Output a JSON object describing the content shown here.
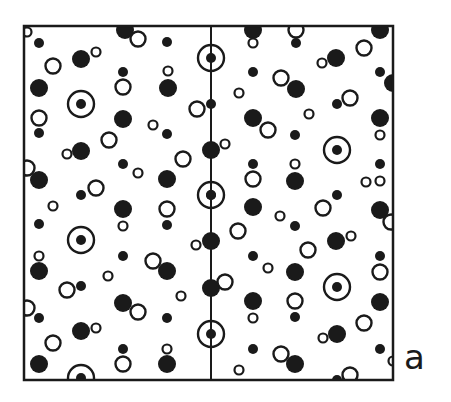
{
  "figure": {
    "panel_label": "a",
    "frame": {
      "x": 24,
      "y": 26,
      "width": 369,
      "height": 354
    },
    "mirror_line_x": 211,
    "colors": {
      "ink": "#1a1a1a",
      "background": "#ffffff"
    },
    "legend_note": "Symbols: filled large disc, filled small disc, open large ring, open small ring, target (ring with central dot)",
    "symbols": [
      {
        "t": "o",
        "x": 27,
        "y": 32
      },
      {
        "t": "f",
        "x": 39,
        "y": 43
      },
      {
        "t": "O",
        "x": 53,
        "y": 66
      },
      {
        "t": "F",
        "x": 81,
        "y": 59
      },
      {
        "t": "o",
        "x": 96,
        "y": 52
      },
      {
        "t": "F",
        "x": 125,
        "y": 30
      },
      {
        "t": "O",
        "x": 138,
        "y": 39
      },
      {
        "t": "f",
        "x": 167,
        "y": 42
      },
      {
        "t": "F",
        "x": 39,
        "y": 88
      },
      {
        "t": "f",
        "x": 123,
        "y": 72
      },
      {
        "t": "O",
        "x": 123,
        "y": 87
      },
      {
        "t": "o",
        "x": 168,
        "y": 71
      },
      {
        "t": "F",
        "x": 168,
        "y": 88
      },
      {
        "t": "T",
        "x": 81,
        "y": 104
      },
      {
        "t": "O",
        "x": 39,
        "y": 118
      },
      {
        "t": "f",
        "x": 39,
        "y": 133
      },
      {
        "t": "F",
        "x": 123,
        "y": 119
      },
      {
        "t": "o",
        "x": 153,
        "y": 125
      },
      {
        "t": "f",
        "x": 167,
        "y": 134
      },
      {
        "t": "T",
        "x": 211,
        "y": 58
      },
      {
        "t": "O",
        "x": 197,
        "y": 109
      },
      {
        "t": "f",
        "x": 211,
        "y": 104
      },
      {
        "t": "o",
        "x": 67,
        "y": 154
      },
      {
        "t": "F",
        "x": 81,
        "y": 151
      },
      {
        "t": "O",
        "x": 109,
        "y": 140
      },
      {
        "t": "f",
        "x": 123,
        "y": 164
      },
      {
        "t": "o",
        "x": 138,
        "y": 173
      },
      {
        "t": "F",
        "x": 167,
        "y": 179
      },
      {
        "t": "O",
        "x": 183,
        "y": 159
      },
      {
        "t": "F",
        "x": 211,
        "y": 150
      },
      {
        "t": "o",
        "x": 225,
        "y": 144
      },
      {
        "t": "O",
        "x": 27,
        "y": 168
      },
      {
        "t": "F",
        "x": 39,
        "y": 180
      },
      {
        "t": "f",
        "x": 81,
        "y": 195
      },
      {
        "t": "O",
        "x": 96,
        "y": 188
      },
      {
        "t": "T",
        "x": 211,
        "y": 195
      },
      {
        "t": "f",
        "x": 211,
        "y": 195
      },
      {
        "t": "o",
        "x": 53,
        "y": 206
      },
      {
        "t": "f",
        "x": 39,
        "y": 224
      },
      {
        "t": "T",
        "x": 81,
        "y": 240
      },
      {
        "t": "F",
        "x": 123,
        "y": 209
      },
      {
        "t": "o",
        "x": 123,
        "y": 226
      },
      {
        "t": "O",
        "x": 167,
        "y": 209
      },
      {
        "t": "f",
        "x": 167,
        "y": 225
      },
      {
        "t": "o",
        "x": 39,
        "y": 256
      },
      {
        "t": "F",
        "x": 39,
        "y": 271
      },
      {
        "t": "f",
        "x": 123,
        "y": 256
      },
      {
        "t": "O",
        "x": 153,
        "y": 261
      },
      {
        "t": "F",
        "x": 167,
        "y": 271
      },
      {
        "t": "F",
        "x": 211,
        "y": 241
      },
      {
        "t": "o",
        "x": 196,
        "y": 245
      },
      {
        "t": "o",
        "x": 108,
        "y": 276
      },
      {
        "t": "O",
        "x": 67,
        "y": 290
      },
      {
        "t": "f",
        "x": 81,
        "y": 286
      },
      {
        "t": "o",
        "x": 181,
        "y": 296
      },
      {
        "t": "O",
        "x": 27,
        "y": 308
      },
      {
        "t": "f",
        "x": 39,
        "y": 318
      },
      {
        "t": "F",
        "x": 123,
        "y": 303
      },
      {
        "t": "O",
        "x": 138,
        "y": 312
      },
      {
        "t": "f",
        "x": 167,
        "y": 318
      },
      {
        "t": "F",
        "x": 211,
        "y": 288
      },
      {
        "t": "O",
        "x": 225,
        "y": 282
      },
      {
        "t": "F",
        "x": 81,
        "y": 331
      },
      {
        "t": "o",
        "x": 96,
        "y": 328
      },
      {
        "t": "O",
        "x": 53,
        "y": 343
      },
      {
        "t": "f",
        "x": 123,
        "y": 349
      },
      {
        "t": "O",
        "x": 123,
        "y": 364
      },
      {
        "t": "o",
        "x": 167,
        "y": 349
      },
      {
        "t": "F",
        "x": 167,
        "y": 364
      },
      {
        "t": "T",
        "x": 211,
        "y": 334
      },
      {
        "t": "F",
        "x": 39,
        "y": 364
      },
      {
        "t": "T",
        "x": 81,
        "y": 378
      },
      {
        "t": "F",
        "x": 253,
        "y": 30
      },
      {
        "t": "O",
        "x": 296,
        "y": 30
      },
      {
        "t": "o",
        "x": 253,
        "y": 43
      },
      {
        "t": "f",
        "x": 296,
        "y": 43
      },
      {
        "t": "F",
        "x": 336,
        "y": 58
      },
      {
        "t": "o",
        "x": 322,
        "y": 63
      },
      {
        "t": "O",
        "x": 364,
        "y": 48
      },
      {
        "t": "F",
        "x": 380,
        "y": 30
      },
      {
        "t": "f",
        "x": 253,
        "y": 72
      },
      {
        "t": "O",
        "x": 281,
        "y": 78
      },
      {
        "t": "F",
        "x": 296,
        "y": 89
      },
      {
        "t": "o",
        "x": 239,
        "y": 93
      },
      {
        "t": "f",
        "x": 380,
        "y": 72
      },
      {
        "t": "O",
        "x": 350,
        "y": 98
      },
      {
        "t": "f",
        "x": 337,
        "y": 104
      },
      {
        "t": "F",
        "x": 393,
        "y": 83
      },
      {
        "t": "F",
        "x": 253,
        "y": 118
      },
      {
        "t": "O",
        "x": 268,
        "y": 130
      },
      {
        "t": "o",
        "x": 309,
        "y": 114
      },
      {
        "t": "f",
        "x": 295,
        "y": 135
      },
      {
        "t": "T",
        "x": 337,
        "y": 150
      },
      {
        "t": "F",
        "x": 380,
        "y": 118
      },
      {
        "t": "o",
        "x": 380,
        "y": 135
      },
      {
        "t": "f",
        "x": 253,
        "y": 164
      },
      {
        "t": "O",
        "x": 253,
        "y": 179
      },
      {
        "t": "o",
        "x": 295,
        "y": 164
      },
      {
        "t": "F",
        "x": 295,
        "y": 181
      },
      {
        "t": "O",
        "x": 323,
        "y": 208
      },
      {
        "t": "f",
        "x": 337,
        "y": 195
      },
      {
        "t": "f",
        "x": 380,
        "y": 164
      },
      {
        "t": "o",
        "x": 366,
        "y": 182
      },
      {
        "t": "F",
        "x": 253,
        "y": 207
      },
      {
        "t": "O",
        "x": 238,
        "y": 231
      },
      {
        "t": "o",
        "x": 280,
        "y": 216
      },
      {
        "t": "f",
        "x": 295,
        "y": 226
      },
      {
        "t": "o",
        "x": 380,
        "y": 181
      },
      {
        "t": "F",
        "x": 380,
        "y": 210
      },
      {
        "t": "O",
        "x": 391,
        "y": 222
      },
      {
        "t": "F",
        "x": 336,
        "y": 241
      },
      {
        "t": "o",
        "x": 351,
        "y": 236
      },
      {
        "t": "O",
        "x": 308,
        "y": 250
      },
      {
        "t": "f",
        "x": 253,
        "y": 256
      },
      {
        "t": "o",
        "x": 268,
        "y": 268
      },
      {
        "t": "F",
        "x": 295,
        "y": 272
      },
      {
        "t": "f",
        "x": 380,
        "y": 256
      },
      {
        "t": "O",
        "x": 380,
        "y": 272
      },
      {
        "t": "F",
        "x": 253,
        "y": 301
      },
      {
        "t": "o",
        "x": 253,
        "y": 318
      },
      {
        "t": "O",
        "x": 295,
        "y": 301
      },
      {
        "t": "f",
        "x": 295,
        "y": 317
      },
      {
        "t": "T",
        "x": 337,
        "y": 287
      },
      {
        "t": "F",
        "x": 380,
        "y": 302
      },
      {
        "t": "O",
        "x": 364,
        "y": 323
      },
      {
        "t": "f",
        "x": 253,
        "y": 349
      },
      {
        "t": "O",
        "x": 281,
        "y": 354
      },
      {
        "t": "F",
        "x": 295,
        "y": 364
      },
      {
        "t": "o",
        "x": 239,
        "y": 370
      },
      {
        "t": "F",
        "x": 337,
        "y": 334
      },
      {
        "t": "o",
        "x": 323,
        "y": 338
      },
      {
        "t": "f",
        "x": 380,
        "y": 349
      },
      {
        "t": "o",
        "x": 393,
        "y": 361
      },
      {
        "t": "O",
        "x": 350,
        "y": 375
      },
      {
        "t": "f",
        "x": 337,
        "y": 380
      }
    ]
  }
}
